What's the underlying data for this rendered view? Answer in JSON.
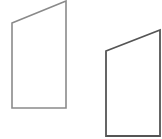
{
  "diagram": {
    "width": 162,
    "height": 139,
    "background": "#ffffff",
    "shapes": [
      {
        "name": "quadrilateral-left",
        "points": [
          [
            12,
            23
          ],
          [
            66,
            1
          ],
          [
            66,
            108
          ],
          [
            12,
            108
          ]
        ],
        "stroke": "#8a8a8a",
        "stroke_width": 1.6
      },
      {
        "name": "quadrilateral-right",
        "points": [
          [
            106,
            51
          ],
          [
            160,
            30
          ],
          [
            160,
            136
          ],
          [
            106,
            136
          ]
        ],
        "stroke": "#555555",
        "stroke_width": 1.8
      }
    ]
  }
}
